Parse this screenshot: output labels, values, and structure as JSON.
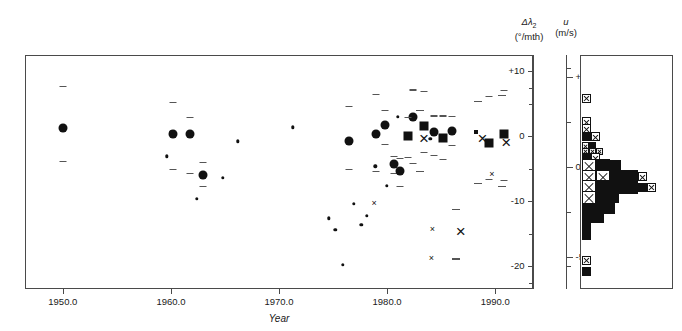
{
  "figure": {
    "xlabel": "Year",
    "left_axis_title_line1": "Δλ",
    "left_axis_title_sub": "2",
    "left_axis_title_line2": "(°/mth)",
    "right_axis_title_line1": "u",
    "right_axis_title_line2": "(m/s)"
  },
  "chart_data": {
    "type": "scatter",
    "title": "",
    "xlabel": "Year",
    "ylabel": "Δλ2 (°/mth)",
    "y2label": "u (m/s)",
    "xlim": [
      1946.5,
      1993.5
    ],
    "ylim": [
      12.5,
      -23.5
    ],
    "y2lim": [
      -6.8,
      6.2
    ],
    "xticks": [
      "1950.0",
      "1960.0",
      "1970.0",
      "1980.0",
      "1990.0"
    ],
    "xtick_values": [
      1950,
      1960,
      1970,
      1980,
      1990
    ],
    "yticks_left": [
      "-20",
      "-10",
      "0",
      "+10"
    ],
    "ytick_values_left": [
      -20,
      -10,
      0,
      10
    ],
    "yticks_left_minor": [
      -15,
      -5,
      5
    ],
    "yticks_right": [
      "+5",
      "0",
      "-5"
    ],
    "ytick_values_right": [
      5,
      0,
      -5
    ],
    "yticks_right_minor": [
      2.5,
      -2.5
    ],
    "grid": false,
    "legend": false,
    "axis_inverted_left": true,
    "series": [
      {
        "name": "large-circle-with-errorbar",
        "marker": "circle-large",
        "points": [
          {
            "x": 1950.0,
            "y": 1.2,
            "err_low": 6.6,
            "err_high": 5.0
          },
          {
            "x": 1960.2,
            "y": 0.3,
            "err_low": 5.0,
            "err_high": 5.3
          },
          {
            "x": 1961.8,
            "y": 0.3,
            "err_low": 2.6,
            "err_high": 6.0
          },
          {
            "x": 1963.0,
            "y": -6.0,
            "err_low": 2.0,
            "err_high": 1.6
          },
          {
            "x": 1976.5,
            "y": -0.8,
            "err_low": 5.5,
            "err_high": 4.3
          },
          {
            "x": 1979.0,
            "y": 0.3,
            "err_low": 6.2,
            "err_high": 5.6
          },
          {
            "x": 1979.8,
            "y": 1.8,
            "err_low": 2.3,
            "err_high": 3.0
          },
          {
            "x": 1980.6,
            "y": -4.2,
            "err_low": 1.2,
            "err_high": 1.5
          },
          {
            "x": 1981.2,
            "y": -5.4,
            "err_low": 2.1,
            "err_high": 2.3
          },
          {
            "x": 1982.4,
            "y": 2.9,
            "err_low": 4.3,
            "err_high": 7.0
          },
          {
            "x": 1984.3,
            "y": 0.6,
            "err_low": 2.6,
            "err_high": 3.5
          },
          {
            "x": 1986.0,
            "y": 0.8,
            "err_low": 2.3,
            "err_high": 2.1
          }
        ]
      },
      {
        "name": "large-square-with-errorbar",
        "marker": "square-large",
        "points": [
          {
            "x": 1981.9,
            "y": 0.0,
            "err_low": 3.0,
            "err_high": 3.2
          },
          {
            "x": 1983.4,
            "y": 1.6,
            "err_low": 5.4,
            "err_high": 4.0
          },
          {
            "x": 1985.2,
            "y": -0.2,
            "err_low": 3.4,
            "err_high": 3.3
          },
          {
            "x": 1989.4,
            "y": -1.0,
            "err_low": 7.2,
            "err_high": 5.6
          },
          {
            "x": 1990.8,
            "y": 0.3,
            "err_low": 6.8,
            "err_high": 7.0
          }
        ]
      },
      {
        "name": "large-cross-with-errorbar",
        "marker": "x-large",
        "points": [
          {
            "x": 1986.4,
            "y": -14.8,
            "err_low": 3.6,
            "err_high": 4.0
          },
          {
            "x": 1983.0,
            "y": -0.4,
            "err_low": 4.4,
            "err_high": 5.0
          },
          {
            "x": 1988.4,
            "y": -0.4,
            "err_low": 5.9,
            "err_high": 6.8
          },
          {
            "x": 1990.6,
            "y": -1.1,
            "err_low": 7.4,
            "err_high": 6.5
          }
        ]
      },
      {
        "name": "small-dot",
        "marker": "circle-small",
        "points": [
          {
            "x": 1959.6,
            "y": -3.1
          },
          {
            "x": 1960.0,
            "y": 0.6
          },
          {
            "x": 1962.4,
            "y": -9.6
          },
          {
            "x": 1964.8,
            "y": -6.4
          },
          {
            "x": 1966.2,
            "y": -0.8
          },
          {
            "x": 1971.3,
            "y": 1.4
          },
          {
            "x": 1974.6,
            "y": -12.6
          },
          {
            "x": 1975.2,
            "y": -14.4
          },
          {
            "x": 1975.9,
            "y": -19.8
          },
          {
            "x": 1976.9,
            "y": -10.4
          },
          {
            "x": 1977.6,
            "y": -13.6
          },
          {
            "x": 1978.1,
            "y": -12.2
          },
          {
            "x": 1978.9,
            "y": -4.6
          },
          {
            "x": 1980.0,
            "y": -7.6
          },
          {
            "x": 1981.0,
            "y": 3.0
          },
          {
            "x": 1984.0,
            "y": -0.4
          }
        ]
      },
      {
        "name": "small-cross",
        "marker": "x-small",
        "points": [
          {
            "x": 1978.6,
            "y": -10.3
          },
          {
            "x": 1983.9,
            "y": -18.8
          },
          {
            "x": 1984.0,
            "y": -14.2
          },
          {
            "x": 1989.5,
            "y": -5.8
          }
        ]
      },
      {
        "name": "small-square",
        "marker": "square-small",
        "points": [
          {
            "x": 1988.2,
            "y": 0.6
          }
        ]
      }
    ]
  },
  "histogram": {
    "orientation": "horizontal",
    "cell_kinds": [
      "filled",
      "cross"
    ],
    "rows": [
      {
        "u": 3.8,
        "cells": [
          {
            "kind": "cross",
            "size": 9
          }
        ]
      },
      {
        "u": 2.5,
        "cells": [
          {
            "kind": "cross",
            "size": 9
          }
        ]
      },
      {
        "u": 2.1,
        "cells": [
          {
            "kind": "cross",
            "size": 9
          }
        ]
      },
      {
        "u": 1.65,
        "cells": [
          {
            "kind": "filled",
            "size": 9
          },
          {
            "kind": "cross",
            "size": 9
          }
        ]
      },
      {
        "u": 1.15,
        "cells": [
          {
            "kind": "cross",
            "size": 7
          },
          {
            "kind": "filled",
            "size": 7
          }
        ]
      },
      {
        "u": 0.85,
        "cells": [
          {
            "kind": "cross",
            "size": 7
          },
          {
            "kind": "cross",
            "size": 7
          },
          {
            "kind": "cross",
            "size": 7
          }
        ]
      },
      {
        "u": 0.5,
        "cells": [
          {
            "kind": "filled",
            "size": 9
          },
          {
            "kind": "cross",
            "size": 9
          }
        ]
      },
      {
        "u": 0.05,
        "cells": [
          {
            "kind": "cross",
            "size": 14
          },
          {
            "kind": "filled",
            "size": 14
          },
          {
            "kind": "filled",
            "size": 11
          }
        ]
      },
      {
        "u": -0.55,
        "cells": [
          {
            "kind": "cross",
            "size": 14
          },
          {
            "kind": "cross",
            "size": 14
          },
          {
            "kind": "filled",
            "size": 14
          },
          {
            "kind": "filled",
            "size": 14
          },
          {
            "kind": "cross",
            "size": 9
          }
        ]
      },
      {
        "u": -1.15,
        "cells": [
          {
            "kind": "cross",
            "size": 14
          },
          {
            "kind": "filled",
            "size": 14
          },
          {
            "kind": "filled",
            "size": 14
          },
          {
            "kind": "filled",
            "size": 14
          },
          {
            "kind": "filled",
            "size": 9
          },
          {
            "kind": "cross",
            "size": 9
          }
        ]
      },
      {
        "u": -1.75,
        "cells": [
          {
            "kind": "cross",
            "size": 14
          },
          {
            "kind": "filled",
            "size": 14
          },
          {
            "kind": "filled",
            "size": 9
          }
        ]
      },
      {
        "u": -2.3,
        "cells": [
          {
            "kind": "filled",
            "size": 11
          },
          {
            "kind": "filled",
            "size": 11
          },
          {
            "kind": "filled",
            "size": 11
          }
        ]
      },
      {
        "u": -2.85,
        "cells": [
          {
            "kind": "filled",
            "size": 11
          },
          {
            "kind": "filled",
            "size": 11
          }
        ]
      },
      {
        "u": -3.35,
        "cells": [
          {
            "kind": "filled",
            "size": 9
          }
        ]
      },
      {
        "u": -3.8,
        "cells": [
          {
            "kind": "filled",
            "size": 9
          }
        ]
      },
      {
        "u": -5.2,
        "cells": [
          {
            "kind": "cross",
            "size": 9
          }
        ]
      },
      {
        "u": -5.85,
        "cells": [
          {
            "kind": "filled",
            "size": 9
          }
        ]
      }
    ]
  }
}
